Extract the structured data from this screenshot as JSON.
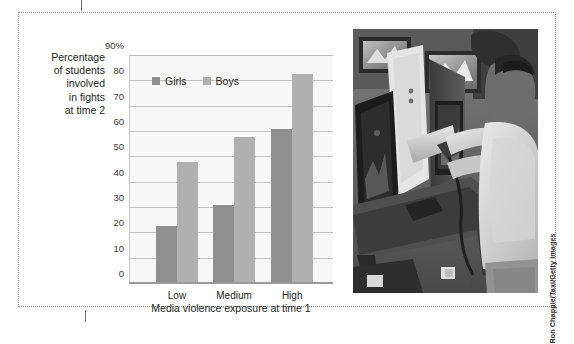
{
  "figure": {
    "photo_credit": "Ron Chapple/Taxi/Getty Images",
    "photo_alt": "Boy playing a light-gun arcade video game in an arcade"
  },
  "chart_data": {
    "type": "bar",
    "title": "",
    "categories": [
      "Low",
      "Medium",
      "High"
    ],
    "series": [
      {
        "name": "Girls",
        "color": "#8f8f8f",
        "values": [
          23,
          31,
          61
        ]
      },
      {
        "name": "Boys",
        "color": "#b0b0b0",
        "values": [
          48,
          58,
          83
        ]
      }
    ],
    "xlabel": "Media violence exposure at time 1",
    "ylabel": "Percentage\nof students\ninvolved\nin fights\nat time 2",
    "ylim": [
      0,
      90
    ],
    "yticks": [
      0,
      10,
      20,
      30,
      40,
      50,
      60,
      70,
      80,
      90
    ],
    "ytick_labels": [
      "0",
      "10",
      "20",
      "30",
      "40",
      "50",
      "60",
      "70",
      "80",
      "90%"
    ],
    "grid": true,
    "legend_position": "upper-left-inside"
  }
}
